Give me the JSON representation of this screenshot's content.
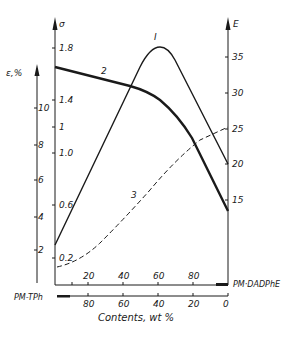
{
  "chart_data": {
    "type": "line",
    "title": "",
    "xlabel": "Contents, wt %",
    "x_axis_top": {
      "name": "PM-DADPhE",
      "ticks": [
        "20",
        "40",
        "60",
        "80"
      ],
      "range": [
        0,
        100
      ]
    },
    "x_axis_bottom": {
      "name": "PM-TPh",
      "ticks": [
        "80",
        "60",
        "40",
        "20",
        "0"
      ],
      "range": [
        100,
        0
      ]
    },
    "y_axes": [
      {
        "id": "sigma",
        "label": "σ",
        "ticks": [
          "0.2",
          "0.6",
          "1.0",
          "1",
          "1.4",
          "1.8"
        ],
        "position": "left-inner"
      },
      {
        "id": "epsilon",
        "label": "ε, %",
        "ticks": [
          "2",
          "4",
          "6",
          "8",
          "10"
        ],
        "position": "left-outer"
      },
      {
        "id": "E",
        "label": "E",
        "ticks": [
          "15",
          "20",
          "25",
          "30",
          "35"
        ],
        "position": "right"
      }
    ],
    "x": [
      0,
      20,
      40,
      60,
      80,
      100
    ],
    "series": [
      {
        "name": "1",
        "label_glyph": "I",
        "axis": "E",
        "style": "solid",
        "x": [
          0,
          20,
          40,
          55,
          60,
          65,
          80,
          100
        ],
        "values": [
          8.7,
          17,
          26,
          35,
          36.3,
          34,
          27.5,
          20
        ]
      },
      {
        "name": "2",
        "axis": "sigma",
        "style": "solid-bold",
        "x": [
          0,
          20,
          40,
          50,
          60,
          70,
          80,
          100
        ],
        "values": [
          1.66,
          1.61,
          1.55,
          1.51,
          1.44,
          1.3,
          1.1,
          0.56
        ]
      },
      {
        "name": "3",
        "axis": "epsilon",
        "style": "dashed",
        "x": [
          0,
          10,
          25,
          40,
          50,
          60,
          80,
          100
        ],
        "values": [
          1.0,
          1.5,
          2.6,
          4.0,
          5.1,
          6.0,
          7.6,
          8.9
        ]
      }
    ],
    "legend": "curves labeled inline (I, 2, 3)",
    "grid": false
  },
  "labels": {
    "sigma_axis": "σ",
    "epsilon_axis": "ε,%",
    "E_axis": "E",
    "curve1": "I",
    "curve2": "2",
    "curve3": "3",
    "right_component": "PM·DADPhE",
    "left_component": "PM-TPh",
    "xlabel": "Contents,  wt %"
  },
  "ticks": {
    "sigma": [
      {
        "t": "1.8",
        "y": 48
      },
      {
        "t": "1.4",
        "y": 100
      },
      {
        "t": "1",
        "y": 127
      },
      {
        "t": "1.0",
        "y": 153
      },
      {
        "t": "0.6",
        "y": 205
      },
      {
        "t": "0.2",
        "y": 258
      }
    ],
    "epsilon": [
      {
        "t": "10",
        "y": 108
      },
      {
        "t": "8",
        "y": 145
      },
      {
        "t": "6",
        "y": 180
      },
      {
        "t": "4",
        "y": 217
      },
      {
        "t": "2",
        "y": 250
      }
    ],
    "E": [
      {
        "t": "35",
        "y": 57
      },
      {
        "t": "30",
        "y": 93
      },
      {
        "t": "25",
        "y": 129
      },
      {
        "t": "20",
        "y": 164
      },
      {
        "t": "15",
        "y": 200
      }
    ],
    "top_x": [
      {
        "t": "20",
        "x": 88
      },
      {
        "t": "40",
        "x": 123
      },
      {
        "t": "60",
        "x": 158
      },
      {
        "t": "80",
        "x": 193
      }
    ],
    "bottom_x": [
      {
        "t": "80",
        "x": 88
      },
      {
        "t": "60",
        "x": 123
      },
      {
        "t": "40",
        "x": 158
      },
      {
        "t": "20",
        "x": 193
      },
      {
        "t": "0",
        "x": 228
      }
    ]
  }
}
